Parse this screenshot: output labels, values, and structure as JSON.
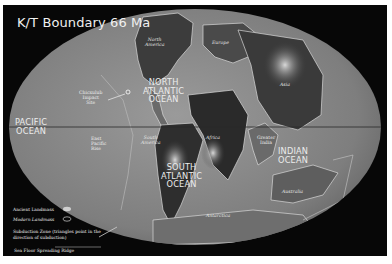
{
  "title": "K/T Boundary 66 Ma",
  "colors": {
    "background": "#070707",
    "ocean": "#8a8a8a",
    "land_dark": "#3a3a3a",
    "label": "#ececec",
    "page_border": "#ffffff"
  },
  "oceans": [
    {
      "name": "pacific",
      "lines": [
        "PACIFIC",
        "OCEAN"
      ]
    },
    {
      "name": "north-atlantic",
      "lines": [
        "NORTH",
        "ATLANTIC",
        "OCEAN"
      ]
    },
    {
      "name": "south-atlantic",
      "lines": [
        "SOUTH",
        "ATLANTIC",
        "OCEAN"
      ]
    },
    {
      "name": "indian",
      "lines": [
        "INDIAN",
        "OCEAN"
      ]
    }
  ],
  "landmasses": {
    "north_america": [
      "North",
      "America"
    ],
    "europe": "Europe",
    "asia": "Asia",
    "south_america": [
      "South",
      "America"
    ],
    "africa": "Africa",
    "greater_india": [
      "Greater",
      "India"
    ],
    "australia": "Australia",
    "antarctica": "Antarctica"
  },
  "features": {
    "chicxulub": [
      "Chicxulub",
      "Impact",
      "Site"
    ],
    "east_pacific_rise": [
      "East",
      "Pacific",
      "Rise"
    ]
  },
  "legend": {
    "ancient_landmass": "Ancient Landmass",
    "modern_landmass": "Modern Landmass",
    "subduction_zone_line1": "Subduction Zone  (triangles point in the",
    "subduction_zone_line2": "direction of subduction)",
    "spreading_ridge": "Sea Floor Spreading Ridge"
  }
}
